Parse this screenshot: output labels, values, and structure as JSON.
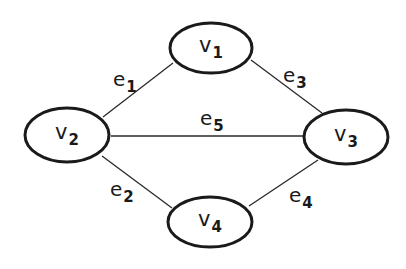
{
  "diagram": {
    "type": "undirected-graph",
    "background": "#ffffff",
    "stroke_color": "#1a1a1a",
    "nodes": [
      {
        "id": "v1",
        "base": "v",
        "sub": "1",
        "cx": 211,
        "cy": 48,
        "rx": 41,
        "ry": 25
      },
      {
        "id": "v2",
        "base": "v",
        "sub": "2",
        "cx": 67,
        "cy": 135,
        "rx": 42,
        "ry": 27
      },
      {
        "id": "v3",
        "base": "v",
        "sub": "3",
        "cx": 346,
        "cy": 137,
        "rx": 42,
        "ry": 27
      },
      {
        "id": "v4",
        "base": "v",
        "sub": "4",
        "cx": 210,
        "cy": 222,
        "rx": 42,
        "ry": 25
      }
    ],
    "edges": [
      {
        "id": "e1",
        "base": "e",
        "sub": "1",
        "from": "v2",
        "to": "v1",
        "x1": 103,
        "y1": 117,
        "x2": 173,
        "y2": 63,
        "lx": 113,
        "ly": 86
      },
      {
        "id": "e2",
        "base": "e",
        "sub": "2",
        "from": "v2",
        "to": "v4",
        "x1": 102,
        "y1": 156,
        "x2": 172,
        "y2": 208,
        "lx": 110,
        "ly": 196
      },
      {
        "id": "e3",
        "base": "e",
        "sub": "3",
        "from": "v1",
        "to": "v3",
        "x1": 251,
        "y1": 60,
        "x2": 322,
        "y2": 113,
        "lx": 283,
        "ly": 82
      },
      {
        "id": "e4",
        "base": "e",
        "sub": "4",
        "from": "v3",
        "to": "v4",
        "x1": 318,
        "y1": 160,
        "x2": 249,
        "y2": 206,
        "lx": 289,
        "ly": 202
      },
      {
        "id": "e5",
        "base": "e",
        "sub": "5",
        "from": "v2",
        "to": "v3",
        "x1": 111,
        "y1": 136,
        "x2": 304,
        "y2": 136,
        "lx": 200,
        "ly": 125
      }
    ]
  }
}
